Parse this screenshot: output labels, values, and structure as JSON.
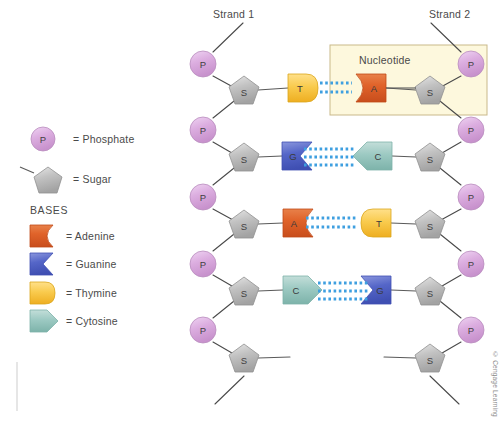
{
  "figure": {
    "title_strand1": "Strand 1",
    "title_strand2": "Strand 2",
    "nucleotide_label": "Nucleotide",
    "copyright": "© Cengage Learning"
  },
  "legend": {
    "phosphate": {
      "symbol": "P",
      "text": "= Phosphate",
      "color": "#d9a8dd"
    },
    "sugar": {
      "symbol": "S",
      "text": "= Sugar",
      "color": "#b8b8b8"
    },
    "bases_heading": "BASES",
    "bases": [
      {
        "symbol": "A",
        "name": "Adenine",
        "text": "= Adenine",
        "color": "#e0632a",
        "shape": "adenine"
      },
      {
        "symbol": "G",
        "name": "Guanine",
        "text": "= Guanine",
        "color": "#5566c8",
        "shape": "guanine"
      },
      {
        "symbol": "T",
        "name": "Thymine",
        "text": "= Thymine",
        "color": "#f6c544",
        "shape": "thymine"
      },
      {
        "symbol": "C",
        "name": "Cytosine",
        "text": "= Cytosine",
        "color": "#9cc9c2",
        "shape": "cytosine"
      }
    ]
  },
  "colors": {
    "phosphate": "#d9a8dd",
    "sugar": "#b8b8b8",
    "adenine": "#e0632a",
    "guanine": "#5566c8",
    "thymine": "#f6c544",
    "cytosine": "#9cc9c2",
    "hbond": "#3e9fe0",
    "backbone": "#4a4a4a",
    "nucleotide_box_fill": "#fdf8dd",
    "nucleotide_box_border": "#c9b98a"
  },
  "strand1": {
    "phosphates": [
      "P",
      "P",
      "P",
      "P",
      "P"
    ],
    "sugars": [
      "S",
      "S",
      "S",
      "S",
      "S"
    ],
    "bases": [
      "T",
      "G",
      "A",
      "C"
    ]
  },
  "strand2": {
    "phosphates": [
      "P",
      "P",
      "P",
      "P",
      "P"
    ],
    "sugars": [
      "S",
      "S",
      "S",
      "S",
      "S"
    ],
    "bases": [
      "A",
      "C",
      "T",
      "G"
    ]
  },
  "base_pairs": [
    {
      "left": "T",
      "right": "A",
      "bonds": 2
    },
    {
      "left": "G",
      "right": "C",
      "bonds": 3
    },
    {
      "left": "A",
      "right": "T",
      "bonds": 2
    },
    {
      "left": "C",
      "right": "G",
      "bonds": 3
    }
  ]
}
